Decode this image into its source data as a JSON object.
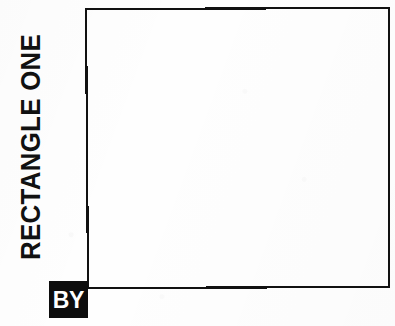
{
  "canvas": {
    "width": 395,
    "height": 326,
    "background_color": "#fefefe",
    "ink_color": "#111111"
  },
  "diagram": {
    "title_label": "RECTANGLE ONE",
    "attribution_label": "BY",
    "shape": {
      "name": "rectangle",
      "style": "outline",
      "stroke_color": "#111111",
      "stroke_width": 2,
      "fill": "none",
      "points": "86,9 389,8 389,287 88,288"
    },
    "badge": {
      "fill_color": "#0d0d0d",
      "text_color": "#ffffff"
    }
  }
}
